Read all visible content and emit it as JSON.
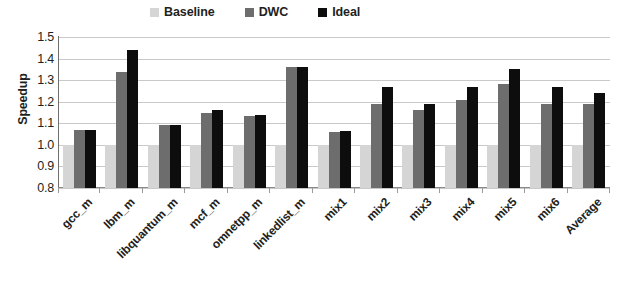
{
  "chart_data": {
    "type": "bar",
    "title": "",
    "xlabel": "",
    "ylabel": "Speedup",
    "ylim": [
      0.8,
      1.5
    ],
    "ytick_labels": [
      "1.5",
      "1.4",
      "1.3",
      "1.2",
      "1.1",
      "1.0",
      "0.9",
      "0.8"
    ],
    "ytick_values": [
      1.5,
      1.4,
      1.3,
      1.2,
      1.1,
      1.0,
      0.9,
      0.8
    ],
    "grid": true,
    "legend_position": "top",
    "categories": [
      "gcc_m",
      "lbm_m",
      "libquantum_m",
      "mcf_m",
      "omnetpp_m",
      "linkedlist_m",
      "mix1",
      "mix2",
      "mix3",
      "mix4",
      "mix5",
      "mix6",
      "Average"
    ],
    "series": [
      {
        "name": "Baseline",
        "color": "#d5d5d5",
        "values": [
          1.0,
          1.0,
          1.0,
          1.0,
          1.0,
          1.0,
          1.0,
          1.0,
          1.0,
          1.0,
          1.0,
          1.0,
          1.0
        ]
      },
      {
        "name": "DWC",
        "color": "#6d6d6d",
        "values": [
          1.07,
          1.34,
          1.09,
          1.15,
          1.135,
          1.36,
          1.06,
          1.19,
          1.16,
          1.21,
          1.28,
          1.19,
          1.19
        ]
      },
      {
        "name": "Ideal",
        "color": "#0d0d0d",
        "values": [
          1.07,
          1.44,
          1.09,
          1.16,
          1.14,
          1.36,
          1.065,
          1.27,
          1.19,
          1.27,
          1.35,
          1.27,
          1.24
        ]
      }
    ]
  }
}
